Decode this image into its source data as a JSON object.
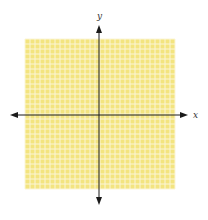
{
  "diagram": {
    "type": "coordinate-grid",
    "grid": {
      "left": 25,
      "top": 39,
      "cells_x": 30,
      "cells_y": 30,
      "cell_size": 5,
      "fill_color": "#F3E47F",
      "line_color": "#FBF5D6"
    },
    "axes": {
      "color": "#1a1a1a",
      "origin_x": 99,
      "origin_y": 115,
      "x_axis": {
        "label": "x",
        "start": 10,
        "end": 188
      },
      "y_axis": {
        "label": "y",
        "start": 25,
        "end": 205
      }
    }
  }
}
